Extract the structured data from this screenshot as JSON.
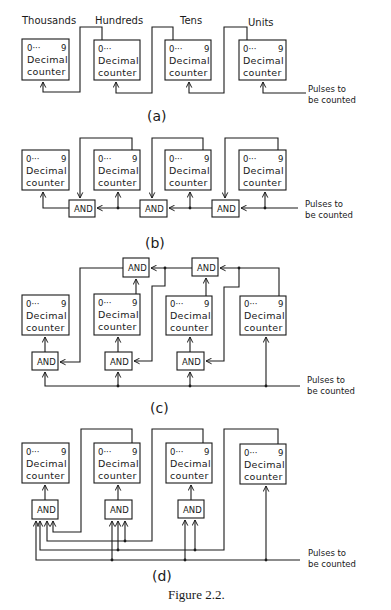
{
  "figure": {
    "caption": "Figure 2.2.",
    "ink_color": "#1a1a1a",
    "background": "#ffffff"
  },
  "counter": {
    "range_low": "0···",
    "range_high": "9",
    "line1": "Decimal",
    "line2": "counter"
  },
  "and_gate_label": "AND",
  "input_label": {
    "line1": "Pulses to",
    "line2": "be counted"
  },
  "panels": [
    {
      "id": "a",
      "label": "(a)",
      "title": "Ripple cascade of decimal counters",
      "digit_labels": [
        "Thousands",
        "Hundreds",
        "Tens",
        "Units"
      ],
      "counters": 4,
      "and_gates": 0
    },
    {
      "id": "b",
      "label": "(b)",
      "title": "Series carry through chained AND gates",
      "counters": 4,
      "and_gates": 3
    },
    {
      "id": "c",
      "label": "(c)",
      "title": "Synchronous counters with carry AND chain",
      "counters": 4,
      "and_gates": 5
    },
    {
      "id": "d",
      "label": "(d)",
      "title": "Synchronous counters with parallel multi-input AND gates",
      "counters": 4,
      "and_gates": 3
    }
  ]
}
